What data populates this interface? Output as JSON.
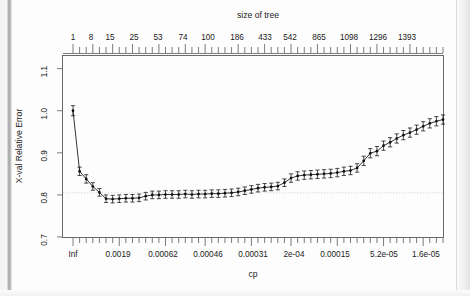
{
  "figure": {
    "top_axis_title": "size of tree",
    "bottom_axis_title": "cp",
    "y_axis_title": "X-val Relative Error"
  },
  "chart_data": {
    "type": "line",
    "title": "size of tree",
    "xlabel": "cp",
    "ylabel": "X-val Relative Error",
    "ylim": [
      0.7,
      1.13
    ],
    "grid": false,
    "legend": "none",
    "error_bars": true,
    "reference_line_y": 0.805,
    "top_axis": {
      "label": "size of tree",
      "tick_labels": [
        "1",
        "8",
        "15",
        "25",
        "53",
        "74",
        "100",
        "186",
        "433",
        "542",
        "865",
        "1098",
        "1296",
        "1393"
      ],
      "tick_x_px": [
        73,
        91,
        110,
        134,
        158,
        183,
        208,
        237,
        265,
        290,
        319,
        349,
        378,
        407
      ]
    },
    "bottom_axis": {
      "label": "cp",
      "tick_labels": [
        "Inf",
        "0.0019",
        "0.00062",
        "0.00046",
        "0.00031",
        "2e-04",
        "0.00015",
        "5.2e-05",
        "1.6e-05"
      ],
      "tick_x_px": [
        73,
        118,
        163,
        208,
        253,
        294,
        335,
        384,
        426
      ]
    },
    "y_ticks": [
      0.7,
      0.8,
      0.9,
      1.0,
      1.1
    ],
    "y_tick_labels": [
      "0.7",
      "0.8",
      "0.9",
      "1.0",
      "1.1"
    ],
    "n_points": 57,
    "values": [
      1.0,
      0.856,
      0.838,
      0.82,
      0.806,
      0.791,
      0.79,
      0.791,
      0.792,
      0.792,
      0.793,
      0.797,
      0.8,
      0.8,
      0.801,
      0.801,
      0.801,
      0.802,
      0.801,
      0.802,
      0.802,
      0.803,
      0.803,
      0.804,
      0.805,
      0.807,
      0.81,
      0.813,
      0.816,
      0.818,
      0.819,
      0.821,
      0.829,
      0.84,
      0.845,
      0.847,
      0.848,
      0.849,
      0.85,
      0.851,
      0.853,
      0.856,
      0.858,
      0.864,
      0.881,
      0.899,
      0.904,
      0.917,
      0.925,
      0.934,
      0.942,
      0.948,
      0.955,
      0.963,
      0.97,
      0.975,
      0.979
    ],
    "error_half_widths": [
      0.012,
      0.01,
      0.01,
      0.009,
      0.009,
      0.009,
      0.009,
      0.009,
      0.009,
      0.009,
      0.009,
      0.009,
      0.009,
      0.009,
      0.009,
      0.009,
      0.009,
      0.009,
      0.009,
      0.009,
      0.009,
      0.009,
      0.009,
      0.009,
      0.009,
      0.009,
      0.009,
      0.009,
      0.009,
      0.009,
      0.009,
      0.009,
      0.009,
      0.01,
      0.01,
      0.01,
      0.01,
      0.01,
      0.01,
      0.01,
      0.01,
      0.01,
      0.01,
      0.01,
      0.011,
      0.011,
      0.011,
      0.011,
      0.011,
      0.011,
      0.011,
      0.011,
      0.011,
      0.011,
      0.011,
      0.011,
      0.011
    ]
  }
}
